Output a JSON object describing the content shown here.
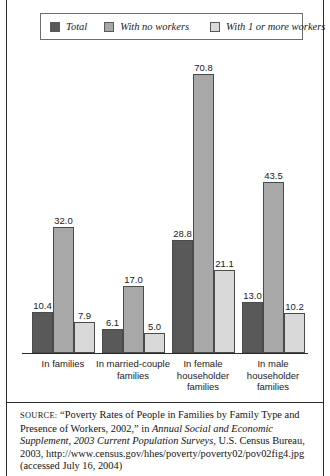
{
  "legend": {
    "items": [
      {
        "label": "Total",
        "color": "#595959",
        "icon": "legend-swatch-total"
      },
      {
        "label": "With no workers",
        "color": "#a8a8a8",
        "icon": "legend-swatch-no-workers"
      },
      {
        "label": "With 1 or more workers",
        "color": "#d9d9d9",
        "icon": "legend-swatch-one-or-more-workers"
      }
    ]
  },
  "chart_data": {
    "type": "bar",
    "title": "",
    "xlabel": "",
    "ylabel": "",
    "ylim": [
      0,
      76
    ],
    "grid": false,
    "legend_position": "top",
    "categories": [
      "In families",
      "In married-couple families",
      "In female householder families",
      "In male householder families"
    ],
    "category_lines": [
      [
        "In families"
      ],
      [
        "In married-couple",
        "families"
      ],
      [
        "In female",
        "householder",
        "families"
      ],
      [
        "In male",
        "householder",
        "families"
      ]
    ],
    "series": [
      {
        "name": "Total",
        "color": "#595959",
        "values": [
          10.4,
          6.1,
          28.8,
          13.0
        ]
      },
      {
        "name": "With no workers",
        "color": "#a8a8a8",
        "values": [
          32.0,
          17.0,
          70.8,
          43.5
        ]
      },
      {
        "name": "With 1 or more workers",
        "color": "#d9d9d9",
        "values": [
          7.9,
          5.0,
          21.1,
          10.2
        ]
      }
    ],
    "value_labels": [
      [
        "10.4",
        "32.0",
        "7.9"
      ],
      [
        "6.1",
        "17.0",
        "5.0"
      ],
      [
        "28.8",
        "70.8",
        "21.1"
      ],
      [
        "13.0",
        "43.5",
        "10.2"
      ]
    ]
  },
  "source": {
    "prefix": "SOURCE:",
    "line1": " “Poverty Rates of People in Families by Family Type and Presence of Workers, 2002,” in ",
    "italic1": "Annual Social and Economic Supplement, 2003 Current Population Surveys,",
    "line2": " U.S. Census Bureau, 2003, http://www.census.gov/hhes/poverty/poverty02/pov02fig4.jpg (accessed July 16, 2004)"
  }
}
